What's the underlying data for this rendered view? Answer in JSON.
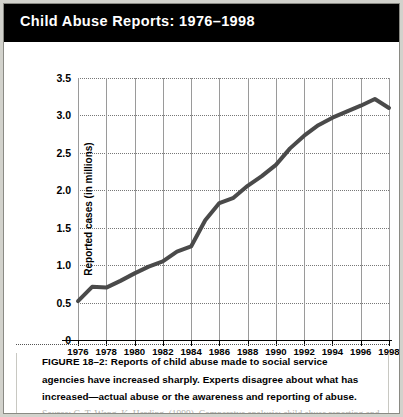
{
  "header": {
    "title": "Child Abuse Reports: 1976–1998"
  },
  "caption": {
    "text": "FIGURE 18–2: Reports of child abuse made to social service agencies have increased sharply. Experts disagree about what has increased—actual abuse or the awareness and reporting of abuse."
  },
  "source": {
    "text": "Source: G. T. Wang, K. Harding. (1999). Comparatve analysis: child abuse reporting and"
  },
  "chart_data": {
    "type": "line",
    "title": "Child Abuse Reports: 1976–1998",
    "xlabel": "",
    "ylabel": "Reported cases (in millions)",
    "ylim": [
      0,
      3.5
    ],
    "xlim": [
      1976,
      1998
    ],
    "grid": true,
    "legend": "none",
    "line_color": "#4a4a4a",
    "y_ticks": [
      "0",
      "0.5",
      "1.0",
      "1.5",
      "2.0",
      "2.5",
      "3.0",
      "3.5"
    ],
    "y_tick_values": [
      0,
      0.5,
      1.0,
      1.5,
      2.0,
      2.5,
      3.0,
      3.5
    ],
    "x_ticks": [
      "1976",
      "1978",
      "1980",
      "1982",
      "1984",
      "1986",
      "1988",
      "1990",
      "1992",
      "1994",
      "1996",
      "1998"
    ],
    "x_tick_values": [
      1976,
      1978,
      1980,
      1982,
      1984,
      1986,
      1988,
      1990,
      1992,
      1994,
      1996,
      1998
    ],
    "x": [
      1976,
      1977,
      1978,
      1979,
      1980,
      1981,
      1982,
      1983,
      1984,
      1985,
      1986,
      1987,
      1988,
      1989,
      1990,
      1991,
      1992,
      1993,
      1994,
      1995,
      1996,
      1997,
      1998
    ],
    "values": [
      0.52,
      0.71,
      0.7,
      0.79,
      0.89,
      0.98,
      1.05,
      1.18,
      1.25,
      1.6,
      1.83,
      1.9,
      2.06,
      2.19,
      2.34,
      2.56,
      2.73,
      2.87,
      2.97,
      3.05,
      3.13,
      3.22,
      3.1
    ],
    "series": [
      {
        "name": "Reported cases (in millions)",
        "values": [
          0.52,
          0.71,
          0.7,
          0.79,
          0.89,
          0.98,
          1.05,
          1.18,
          1.25,
          1.6,
          1.83,
          1.9,
          2.06,
          2.19,
          2.34,
          2.56,
          2.73,
          2.87,
          2.97,
          3.05,
          3.13,
          3.22,
          3.1
        ]
      }
    ]
  }
}
